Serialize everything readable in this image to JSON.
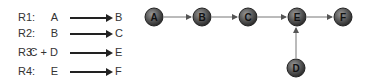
{
  "reactions": [
    {
      "label": "R1:",
      "lhs": "A",
      "rhs": "B"
    },
    {
      "label": "R2:",
      "lhs": "B",
      "rhs": "C"
    },
    {
      "label": "R3:",
      "lhs": "C + D",
      "rhs": "E"
    },
    {
      "label": "R4:",
      "lhs": "E",
      "rhs": "F"
    }
  ],
  "graph": {
    "nodes": [
      {
        "id": "A",
        "label": "A"
      },
      {
        "id": "B",
        "label": "B"
      },
      {
        "id": "C",
        "label": "C"
      },
      {
        "id": "E",
        "label": "E"
      },
      {
        "id": "F",
        "label": "F"
      },
      {
        "id": "D",
        "label": "D"
      }
    ],
    "edges": [
      {
        "from": "A",
        "to": "B"
      },
      {
        "from": "B",
        "to": "C"
      },
      {
        "from": "C",
        "to": "E"
      },
      {
        "from": "E",
        "to": "F"
      },
      {
        "from": "D",
        "to": "E"
      }
    ]
  },
  "colors": {
    "node_fill": "#555555",
    "node_stroke": "#222222",
    "edge": "#777777"
  }
}
